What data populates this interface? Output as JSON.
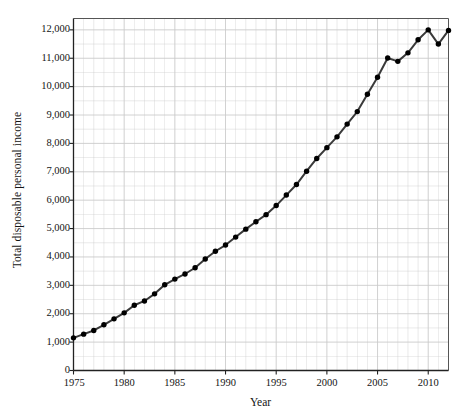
{
  "chart_data": {
    "type": "line",
    "title": "",
    "xlabel": "Year",
    "ylabel": "Total disposable personal income",
    "xlim": [
      1975,
      2012
    ],
    "ylim": [
      0,
      12400
    ],
    "grid": true,
    "legend": false,
    "marker": "filled-circle",
    "line_color": "#3a3a3a",
    "marker_color": "#000000",
    "grid_color": "#c9c9c9",
    "x_tick_labels": [
      "1975",
      "1980",
      "1985",
      "1990",
      "1995",
      "2000",
      "2005",
      "2010"
    ],
    "x_tick_values": [
      1975,
      1980,
      1985,
      1990,
      1995,
      2000,
      2005,
      2010
    ],
    "x_minor_step": 1,
    "y_tick_labels": [
      "0",
      "1,000",
      "2,000",
      "3,000",
      "4,000",
      "5,000",
      "6,000",
      "7,000",
      "8,000",
      "9,000",
      "10,000",
      "11,000",
      "12,000"
    ],
    "y_tick_values": [
      0,
      1000,
      2000,
      3000,
      4000,
      5000,
      6000,
      7000,
      8000,
      9000,
      10000,
      11000,
      12000
    ],
    "y_minor_step": 500,
    "x": [
      1975,
      1976,
      1977,
      1978,
      1979,
      1980,
      1981,
      1982,
      1983,
      1984,
      1985,
      1986,
      1987,
      1988,
      1989,
      1990,
      1991,
      1992,
      1993,
      1994,
      1995,
      1996,
      1997,
      1998,
      1999,
      2000,
      2001,
      2002,
      2003,
      2004,
      2005,
      2006,
      2007,
      2008,
      2009,
      2010,
      2011,
      2012
    ],
    "values": [
      1150,
      1280,
      1410,
      1610,
      1820,
      2030,
      2300,
      2450,
      2700,
      3020,
      3220,
      3400,
      3620,
      3930,
      4200,
      4420,
      4700,
      4980,
      5240,
      5490,
      5810,
      6180,
      6550,
      7020,
      7470,
      7850,
      8230,
      8680,
      9120,
      9730,
      10330,
      11010,
      10890,
      11190,
      11650,
      12000,
      11500,
      11980
    ],
    "series": [
      {
        "name": "Total disposable personal income",
        "values": [
          1150,
          1280,
          1410,
          1610,
          1820,
          2030,
          2300,
          2450,
          2700,
          3020,
          3220,
          3400,
          3620,
          3930,
          4200,
          4420,
          4700,
          4980,
          5240,
          5490,
          5810,
          6180,
          6550,
          7020,
          7470,
          7850,
          8230,
          8680,
          9120,
          9730,
          10330,
          11010,
          10890,
          11190,
          11650,
          12000,
          11500,
          11980
        ]
      }
    ]
  }
}
